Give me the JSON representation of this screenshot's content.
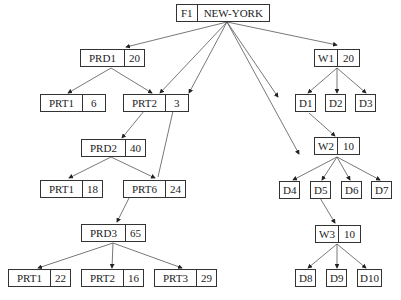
{
  "diagram": {
    "type": "tree",
    "nodes": {
      "root": {
        "code": "F1",
        "label": "NEW-YORK"
      },
      "prd1": {
        "code": "PRD1",
        "value": "20"
      },
      "prd1_prt1": {
        "code": "PRT1",
        "value": "6"
      },
      "prd1_prt2": {
        "code": "PRT2",
        "value": "3"
      },
      "prd2": {
        "code": "PRD2",
        "value": "40"
      },
      "prd2_prt1": {
        "code": "PRT1",
        "value": "18"
      },
      "prd2_prt6": {
        "code": "PRT6",
        "value": "24"
      },
      "prd3": {
        "code": "PRD3",
        "value": "65"
      },
      "prd3_prt1": {
        "code": "PRT1",
        "value": "22"
      },
      "prd3_prt2": {
        "code": "PRT2",
        "value": "16"
      },
      "prd3_prt3": {
        "code": "PRT3",
        "value": "29"
      },
      "w1": {
        "code": "W1",
        "value": "20"
      },
      "d1": {
        "code": "D1"
      },
      "d2": {
        "code": "D2"
      },
      "d3": {
        "code": "D3"
      },
      "w2": {
        "code": "W2",
        "value": "10"
      },
      "d4": {
        "code": "D4"
      },
      "d5": {
        "code": "D5"
      },
      "d6": {
        "code": "D6"
      },
      "d7": {
        "code": "D7"
      },
      "w3": {
        "code": "W3",
        "value": "10"
      },
      "d8": {
        "code": "D8"
      },
      "d9": {
        "code": "D9"
      },
      "d10": {
        "code": "D10"
      }
    },
    "edges": [
      [
        "root",
        "prd1"
      ],
      [
        "root",
        "prd1_prt2"
      ],
      [
        "root",
        "prd2_prt6"
      ],
      [
        "root",
        "d4"
      ],
      [
        "root",
        "d1"
      ],
      [
        "root",
        "w1"
      ],
      [
        "prd1",
        "prd1_prt1"
      ],
      [
        "prd1",
        "prd1_prt2"
      ],
      [
        "prd1_prt2",
        "prd2"
      ],
      [
        "prd2",
        "prd2_prt1"
      ],
      [
        "prd2",
        "prd2_prt6"
      ],
      [
        "prd2_prt6",
        "prd3"
      ],
      [
        "prd3",
        "prd3_prt1"
      ],
      [
        "prd3",
        "prd3_prt2"
      ],
      [
        "prd3",
        "prd3_prt3"
      ],
      [
        "w1",
        "d1"
      ],
      [
        "w1",
        "d2"
      ],
      [
        "w1",
        "d3"
      ],
      [
        "d1",
        "w2"
      ],
      [
        "w2",
        "d4"
      ],
      [
        "w2",
        "d5"
      ],
      [
        "w2",
        "d6"
      ],
      [
        "w2",
        "d7"
      ],
      [
        "d5",
        "w3"
      ],
      [
        "w3",
        "d8"
      ],
      [
        "w3",
        "d9"
      ],
      [
        "w3",
        "d10"
      ]
    ]
  }
}
